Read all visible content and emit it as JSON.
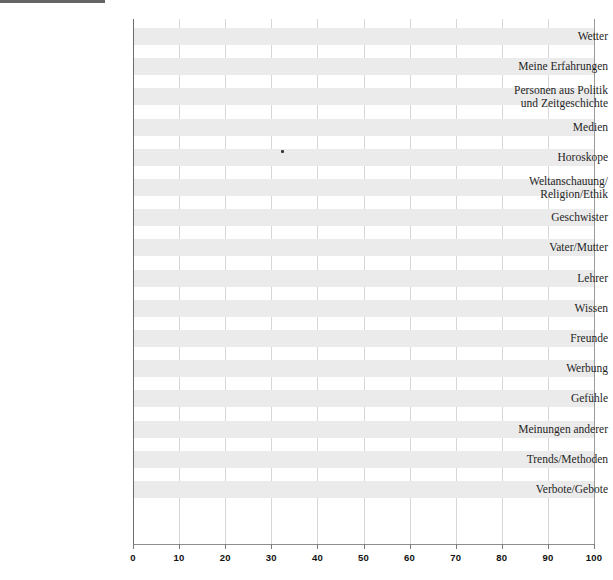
{
  "chart_data": {
    "type": "bar",
    "orientation": "horizontal",
    "title": "",
    "subtitle": "",
    "xlabel": "",
    "ylabel": "",
    "xlim": [
      0,
      100
    ],
    "ylim": null,
    "grid": "vertical",
    "legend": null,
    "legend_position": "none",
    "xticks": [
      0,
      10,
      20,
      30,
      40,
      50,
      60,
      70,
      80,
      90,
      100
    ],
    "xtick_labels": [
      "0",
      "10",
      "20",
      "30",
      "40",
      "50",
      "60",
      "70",
      "80",
      "90",
      "100"
    ],
    "categories": [
      "Wetter",
      "Meine Erfahrungen",
      "Personen aus Politik\nund Zeitgeschichte",
      "Medien",
      "Horoskope",
      "Weltanschauung/\nReligion/Ethik",
      "Geschwister",
      "Vater/Mutter",
      "Lehrer",
      "Wissen",
      "Freunde",
      "Werbung",
      "Gefühle",
      "Meinungen anderer",
      "Trends/Methoden",
      "Verbote/Gebote"
    ],
    "values": [
      0,
      0,
      0,
      0,
      0,
      0,
      0,
      0,
      0,
      0,
      0,
      0,
      0,
      0,
      0,
      0
    ],
    "annotations": [
      {
        "name": "scan-speck",
        "x": 32,
        "category": "Medien",
        "text": ""
      }
    ],
    "colors": {
      "band": "#ebebeb",
      "bar": "#bdbdbd",
      "gridline": "#d7d7d7",
      "axis": "#6b6b6b",
      "text": "#1f1f1f"
    }
  },
  "axis": {
    "x": {
      "ticks": [
        "0",
        "10",
        "20",
        "30",
        "40",
        "50",
        "60",
        "70",
        "80",
        "90",
        "100"
      ]
    }
  },
  "categories": [
    {
      "label": "Wetter",
      "value": 0
    },
    {
      "label": "Meine Erfahrungen",
      "value": 0
    },
    {
      "label": "Personen aus Politik\nund Zeitgeschichte",
      "value": 0
    },
    {
      "label": "Medien",
      "value": 0
    },
    {
      "label": "Horoskope",
      "value": 0
    },
    {
      "label": "Weltanschauung/\nReligion/Ethik",
      "value": 0
    },
    {
      "label": "Geschwister",
      "value": 0
    },
    {
      "label": "Vater/Mutter",
      "value": 0
    },
    {
      "label": "Lehrer",
      "value": 0
    },
    {
      "label": "Wissen",
      "value": 0
    },
    {
      "label": "Freunde",
      "value": 0
    },
    {
      "label": "Werbung",
      "value": 0
    },
    {
      "label": "Gefühle",
      "value": 0
    },
    {
      "label": "Meinungen anderer",
      "value": 0
    },
    {
      "label": "Trends/Methoden",
      "value": 0
    },
    {
      "label": "Verbote/Gebote",
      "value": 0
    }
  ]
}
